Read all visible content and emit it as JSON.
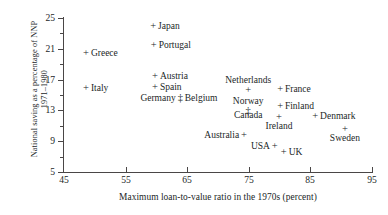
{
  "chart_data": {
    "type": "scatter",
    "title": "",
    "xlabel": "Maximum loan-to-value ratio in the 1970s (percent)",
    "ylabel_line1": "National saving as a percentage of NNP",
    "ylabel_line2": "1971–1980",
    "xlim": [
      45,
      95
    ],
    "ylim": [
      5,
      25
    ],
    "xticks": [
      45,
      55,
      65,
      75,
      85,
      95
    ],
    "yticks": [
      5,
      9,
      13,
      17,
      21,
      25
    ],
    "xtick_labels": [
      "45",
      "55",
      "65",
      "75",
      "85",
      "95"
    ],
    "ytick_labels": [
      "5",
      "9",
      "13",
      "17",
      "21",
      "25"
    ],
    "x_minor_step": 5,
    "y_minor_step": 2,
    "grid": false,
    "legend": "none",
    "marker": "+",
    "points": [
      {
        "label": "Japan",
        "x": 59.0,
        "y": 23.9,
        "label_pos": "right",
        "marker": "+"
      },
      {
        "label": "Portugal",
        "x": 59.1,
        "y": 21.5,
        "label_pos": "right",
        "marker": "+"
      },
      {
        "label": "Greece",
        "x": 48.1,
        "y": 20.5,
        "label_pos": "right",
        "marker": "+"
      },
      {
        "label": "Austria",
        "x": 59.3,
        "y": 17.5,
        "label_pos": "right",
        "marker": "+"
      },
      {
        "label": "Spain",
        "x": 59.3,
        "y": 16.0,
        "label_pos": "right",
        "marker": "+"
      },
      {
        "label": "Italy",
        "x": 48.1,
        "y": 15.9,
        "label_pos": "right",
        "marker": "+"
      },
      {
        "label": "Netherlands",
        "x": 74.9,
        "y": 15.8,
        "label_pos": "above",
        "marker": "+"
      },
      {
        "label": "Germany",
        "x": 64.3,
        "y": 14.6,
        "label_pos": "left",
        "marker": "‡"
      },
      {
        "label": "Belgium",
        "x": 64.3,
        "y": 14.6,
        "label_pos": "right",
        "marker": ""
      },
      {
        "label": "France",
        "x": 79.6,
        "y": 15.8,
        "label_pos": "right",
        "marker": "+"
      },
      {
        "label": "Norway",
        "x": 74.9,
        "y": 13.0,
        "label_pos": "above",
        "marker": "‡"
      },
      {
        "label": "Finland",
        "x": 79.6,
        "y": 13.6,
        "label_pos": "right",
        "marker": "+"
      },
      {
        "label": "Canada",
        "x": 74.9,
        "y": 13.0,
        "label_pos": "below",
        "marker": ""
      },
      {
        "label": "Ireland",
        "x": 79.9,
        "y": 12.3,
        "label_pos": "below",
        "marker": "+"
      },
      {
        "label": "Denmark",
        "x": 85.3,
        "y": 12.3,
        "label_pos": "right",
        "marker": "+"
      },
      {
        "label": "Sweden",
        "x": 90.6,
        "y": 10.7,
        "label_pos": "below",
        "marker": "+"
      },
      {
        "label": "Australia",
        "x": 74.7,
        "y": 9.8,
        "label_pos": "left",
        "marker": "+"
      },
      {
        "label": "USA",
        "x": 79.7,
        "y": 8.4,
        "label_pos": "left",
        "marker": "+"
      },
      {
        "label": "UK",
        "x": 80.2,
        "y": 7.6,
        "label_pos": "right",
        "marker": "+"
      }
    ]
  },
  "axis": {
    "x_title": "Maximum loan-to-value ratio in the 1970s (percent)",
    "y_title_line1": "National saving as a percentage of NNP",
    "y_title_line2": "1971–1980"
  },
  "colors": {
    "ink": "#221f1f",
    "axis": "#4a4646",
    "background": "#ffffff"
  }
}
